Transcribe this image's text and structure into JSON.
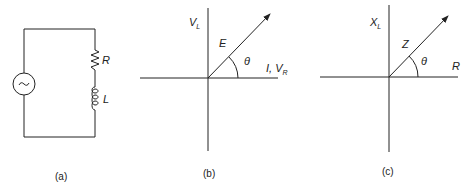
{
  "figure": {
    "panels": [
      {
        "id": "a",
        "caption": "(a)",
        "type": "series RL circuit",
        "components": [
          {
            "name": "ac-source",
            "symbol": "~"
          },
          {
            "name": "resistor",
            "label": "R"
          },
          {
            "name": "inductor",
            "label": "L"
          }
        ]
      },
      {
        "id": "b",
        "caption": "(b)",
        "type": "voltage phasor diagram",
        "vertical_axis_label": {
          "main": "V",
          "sub": "L"
        },
        "horizontal_axis_label": {
          "main": "I, V",
          "sub": "R"
        },
        "vector_label": "E",
        "angle_label": "θ"
      },
      {
        "id": "c",
        "caption": "(c)",
        "type": "impedance diagram",
        "vertical_axis_label": {
          "main": "X",
          "sub": "L"
        },
        "horizontal_axis_label": {
          "main": "R",
          "sub": ""
        },
        "vector_label": "Z",
        "angle_label": "θ"
      }
    ],
    "colors": {
      "ink": "#222222",
      "background": "#ffffff"
    }
  }
}
